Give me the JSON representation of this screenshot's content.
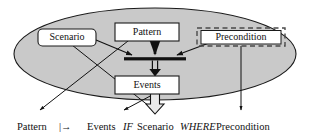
{
  "diagram": {
    "container": {
      "shape": "ellipse",
      "fill_color": "#c9c9c9",
      "stroke_color": "#1a1a1a"
    },
    "nodes": [
      {
        "id": "scenario",
        "label": "Scenario",
        "style": "rounded-solid",
        "fill_color": "#ffffff",
        "stroke_color": "#1a1a1a"
      },
      {
        "id": "pattern",
        "label": "Pattern",
        "style": "square-solid",
        "fill_color": "#ffffff",
        "stroke_color": "#1a1a1a"
      },
      {
        "id": "precondition",
        "label": "Precondition",
        "style": "square-solid-with-dashed-outline",
        "fill_color": "#ffffff",
        "stroke_color": "#1a1a1a",
        "outline_color": "#4a4a4a"
      },
      {
        "id": "events",
        "label": "Events",
        "style": "square-solid",
        "fill_color": "#ffffff",
        "stroke_color": "#1a1a1a"
      }
    ],
    "junction_bar": {
      "id": "merge-bar",
      "fill_color": "#111111"
    },
    "formula": {
      "parts": [
        {
          "text": "Pattern",
          "style": "roman"
        },
        {
          "text": "|→",
          "style": "roman"
        },
        {
          "text": "Events",
          "style": "roman"
        },
        {
          "text": "IF",
          "style": "italic"
        },
        {
          "text": "Scenario",
          "style": "roman"
        },
        {
          "text": "WHERE",
          "style": "italic"
        },
        {
          "text": "Precondition",
          "style": "roman"
        }
      ],
      "token_pattern": "Pattern",
      "token_maps_to": "|→",
      "token_events": "Events",
      "token_if": "IF",
      "token_scenario": "Scenario",
      "token_where": "WHERE",
      "token_precondition": "Precondition"
    }
  }
}
